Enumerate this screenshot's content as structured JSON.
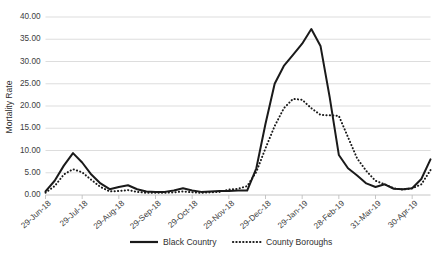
{
  "chart_data": {
    "type": "line",
    "title": "",
    "subtitle": "",
    "xlabel": "",
    "ylabel": "Mortality Rate",
    "ylim": [
      0,
      40
    ],
    "ytick_labels": [
      "0.00",
      "5.00",
      "10.00",
      "15.00",
      "20.00",
      "25.00",
      "30.00",
      "35.00",
      "40.00"
    ],
    "ytick_values": [
      0,
      5,
      10,
      15,
      20,
      25,
      30,
      35,
      40
    ],
    "grid": true,
    "legend_position": "bottom",
    "xtick_labels": [
      "29-Jun-18",
      "29-Jul-18",
      "29-Aug-18",
      "29-Sep-18",
      "29-Oct-18",
      "29-Nov-18",
      "29-Dec-18",
      "29-Jan-19",
      "28-Feb-19",
      "31-Mar-19",
      "30-Apr-19"
    ],
    "xtick_indices": [
      0,
      4,
      8,
      12,
      16,
      20,
      24,
      28,
      32,
      36,
      40
    ],
    "x_count": 43,
    "series": [
      {
        "name": "Black Country",
        "style": "solid",
        "color": "#1a1a1a",
        "values": [
          0.8,
          3.2,
          6.6,
          9.4,
          7.3,
          4.6,
          2.6,
          1.3,
          1.8,
          2.2,
          1.3,
          0.8,
          0.7,
          0.7,
          1.0,
          1.5,
          1.0,
          0.7,
          0.8,
          0.9,
          0.9,
          1.0,
          1.0,
          6.0,
          16.0,
          25.0,
          29.0,
          31.5,
          34.0,
          37.3,
          33.5,
          22.0,
          9.0,
          6.0,
          4.4,
          2.6,
          1.8,
          2.4,
          1.4,
          1.3,
          1.5,
          3.6,
          8.0
        ]
      },
      {
        "name": "County Boroughs",
        "style": "dotted",
        "color": "#1a1a1a",
        "values": [
          0.5,
          2.0,
          4.6,
          5.8,
          5.1,
          3.4,
          1.8,
          0.8,
          0.9,
          1.1,
          0.7,
          0.5,
          0.5,
          0.5,
          0.6,
          0.8,
          0.6,
          0.5,
          0.6,
          0.7,
          1.2,
          1.4,
          2.0,
          5.2,
          10.5,
          15.5,
          19.5,
          21.6,
          21.4,
          19.5,
          18.0,
          17.9,
          17.8,
          13.0,
          8.2,
          5.4,
          3.2,
          2.4,
          1.5,
          1.2,
          1.5,
          2.4,
          5.6
        ]
      }
    ],
    "series_extended": {
      "note": "Values read against left axis gridlines at 5-unit intervals",
      "x_labels_full": [
        "29-Jun-18",
        "06-Jul-18",
        "13-Jul-18",
        "20-Jul-18",
        "29-Jul-18",
        "05-Aug-18",
        "12-Aug-18",
        "19-Aug-18",
        "29-Aug-18",
        "05-Sep-18",
        "12-Sep-18",
        "19-Sep-18",
        "29-Sep-18",
        "06-Oct-18",
        "13-Oct-18",
        "20-Oct-18",
        "29-Oct-18",
        "05-Nov-18",
        "12-Nov-18",
        "19-Nov-18",
        "29-Nov-18",
        "06-Dec-18",
        "13-Dec-18",
        "20-Dec-18",
        "29-Dec-18",
        "05-Jan-19",
        "12-Jan-19",
        "19-Jan-19",
        "29-Jan-19",
        "05-Feb-19",
        "12-Feb-19",
        "19-Feb-19",
        "28-Feb-19",
        "07-Mar-19",
        "14-Mar-19",
        "21-Mar-19",
        "31-Mar-19",
        "07-Apr-19",
        "14-Apr-19",
        "21-Apr-19",
        "30-Apr-19",
        "07-May-19",
        "14-May-19"
      ]
    }
  },
  "legend": {
    "items": [
      {
        "label": "Black Country",
        "style": "solid"
      },
      {
        "label": "County Boroughs",
        "style": "dotted"
      }
    ]
  }
}
